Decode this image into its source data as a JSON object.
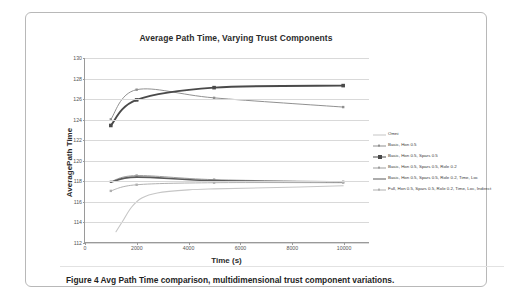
{
  "figure": {
    "caption": "Figure 4 Avg Path Time comparison, multidimensional trust component variations."
  },
  "chart_data": {
    "type": "line",
    "title": "Average Path Time, Varying Trust Components",
    "xlabel": "Time (s)",
    "ylabel": "AveragePath Time",
    "xlim": [
      0,
      11000
    ],
    "ylim": [
      112,
      130
    ],
    "xticks": [
      0,
      2000,
      4000,
      6000,
      8000,
      10000
    ],
    "xtick_labels": [
      "0",
      "2000",
      "4000",
      "6000",
      "8000",
      "10000"
    ],
    "yticks": [
      112,
      114,
      116,
      118,
      120,
      122,
      124,
      126,
      128,
      130
    ],
    "ytick_labels": [
      "112",
      "114",
      "116",
      "118",
      "120",
      "122",
      "124",
      "126",
      "128",
      "130"
    ],
    "grid": "horizontal",
    "legend_position": "right",
    "x": [
      1000,
      2000,
      5000,
      10000
    ],
    "series": [
      {
        "name": "Omni",
        "color": "#c6c6c6",
        "width": 1.1,
        "marker": "none",
        "x": [
          1200,
          1500,
          1800,
          2200,
          2800,
          4000,
          5000,
          7000,
          10000
        ],
        "values": [
          113.0,
          114.2,
          115.4,
          116.3,
          116.8,
          117.1,
          117.2,
          117.3,
          117.5
        ]
      },
      {
        "name": "Basic, Hon 0.5",
        "color": "#8f8f8f",
        "width": 1.0,
        "marker": "square-small",
        "values": [
          124.0,
          126.9,
          126.1,
          125.2
        ]
      },
      {
        "name": "Basic, Hon 0.5, Spars 0.5",
        "color": "#4a4a4a",
        "width": 1.9,
        "marker": "square-bold",
        "values": [
          123.4,
          125.9,
          127.1,
          127.3
        ]
      },
      {
        "name": "Basic, Hon 0.5, Spars 0.5, Role 0.2",
        "color": "#9d9d9d",
        "width": 1.0,
        "marker": "square-small",
        "values": [
          117.9,
          118.5,
          118.1,
          117.9
        ]
      },
      {
        "name": "Basic, Hon 0.5, Spars 0.5, Role 0.2, Time, Loc",
        "color": "#5a5a5a",
        "width": 1.7,
        "marker": "none",
        "values": [
          117.85,
          118.35,
          118.0,
          117.85
        ]
      },
      {
        "name": "Full, Hon 0.5, Spars 0.5, Role 0.2, Time, Loc, Indirect",
        "color": "#b0b0b0",
        "width": 1.0,
        "marker": "square-small",
        "values": [
          117.0,
          117.6,
          117.8,
          117.8
        ]
      }
    ]
  }
}
